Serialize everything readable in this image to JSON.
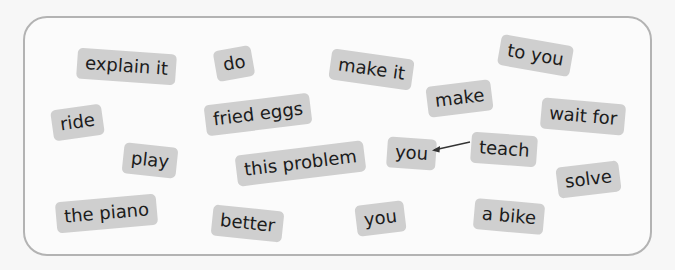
{
  "exercise": {
    "chips": [
      {
        "id": "explain-it",
        "label": "explain it",
        "x": 77,
        "y": 51,
        "rot": 4
      },
      {
        "id": "do",
        "label": "do",
        "x": 215,
        "y": 48,
        "rot": -10
      },
      {
        "id": "make-it",
        "label": "make it",
        "x": 330,
        "y": 54,
        "rot": 8
      },
      {
        "id": "to-you",
        "label": "to you",
        "x": 499,
        "y": 38,
        "rot": 10
      },
      {
        "id": "ride",
        "label": "ride",
        "x": 52,
        "y": 107,
        "rot": -8
      },
      {
        "id": "fried-eggs",
        "label": "fried eggs",
        "x": 205,
        "y": 99,
        "rot": -7
      },
      {
        "id": "make",
        "label": "make",
        "x": 426,
        "y": 84,
        "rot": -7
      },
      {
        "id": "wait-for",
        "label": "wait for",
        "x": 541,
        "y": 101,
        "rot": 5
      },
      {
        "id": "play",
        "label": "play",
        "x": 123,
        "y": 145,
        "rot": 6
      },
      {
        "id": "this-problem",
        "label": "this problem",
        "x": 236,
        "y": 148,
        "rot": -7
      },
      {
        "id": "you-1",
        "label": "you",
        "x": 386,
        "y": 138,
        "rot": 4
      },
      {
        "id": "teach",
        "label": "teach",
        "x": 471,
        "y": 134,
        "rot": 4
      },
      {
        "id": "solve",
        "label": "solve",
        "x": 557,
        "y": 164,
        "rot": -7
      },
      {
        "id": "the-piano",
        "label": "the piano",
        "x": 56,
        "y": 198,
        "rot": -5
      },
      {
        "id": "better",
        "label": "better",
        "x": 212,
        "y": 208,
        "rot": 6
      },
      {
        "id": "you-2",
        "label": "you",
        "x": 356,
        "y": 203,
        "rot": -7
      },
      {
        "id": "a-bike",
        "label": "a bike",
        "x": 474,
        "y": 201,
        "rot": 5
      }
    ],
    "arrow": {
      "from": "teach",
      "to": "you-1"
    },
    "colors": {
      "chip_bg": "#cfcfcf",
      "chip_text": "#1c1c1c",
      "border": "#b3b3b3"
    }
  }
}
